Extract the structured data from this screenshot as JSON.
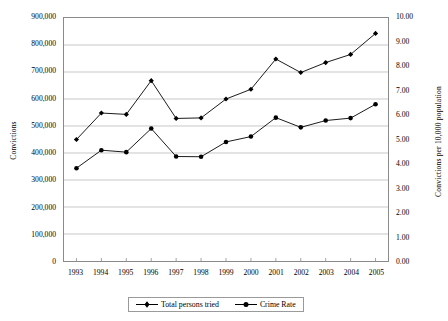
{
  "chart_data": {
    "type": "line",
    "title": "",
    "subtitle": "",
    "xlabel": "",
    "ylabel": "Convictions",
    "y2label": "Convictions per 10,000 population",
    "grid": true,
    "legend_position": "bottom",
    "categories": [
      "1993",
      "1994",
      "1995",
      "1996",
      "1997",
      "1998",
      "1999",
      "2000",
      "2001",
      "2002",
      "2003",
      "2004",
      "2005"
    ],
    "ylim": [
      0,
      900000
    ],
    "yticks": [
      "0",
      "100,000",
      "200,000",
      "300,000",
      "400,000",
      "500,000",
      "600,000",
      "700,000",
      "800,000",
      "900,000"
    ],
    "ytick_values": [
      0,
      100000,
      200000,
      300000,
      400000,
      500000,
      600000,
      700000,
      800000,
      900000
    ],
    "y2lim": [
      0,
      10
    ],
    "y2ticks": [
      "0.00",
      "1.00",
      "2.00",
      "3.00",
      "4.00",
      "5.00",
      "6.00",
      "7.00",
      "8.00",
      "9.00",
      "10.00"
    ],
    "y2tick_values": [
      0,
      1,
      2,
      3,
      4,
      5,
      6,
      7,
      8,
      9,
      10
    ],
    "series": [
      {
        "name": "Total persons tried",
        "axis": "left",
        "color": "#000000",
        "marker": "diamond",
        "values": [
          450000,
          548000,
          543000,
          668000,
          528000,
          530000,
          600000,
          636000,
          748000,
          698000,
          735000,
          765000,
          843000
        ]
      },
      {
        "name": "Crime Rate",
        "axis": "right",
        "color": "#000000",
        "marker": "circle",
        "values": [
          3.82,
          4.56,
          4.48,
          5.45,
          4.3,
          4.29,
          4.9,
          5.12,
          5.9,
          5.5,
          5.78,
          5.88,
          6.45
        ]
      }
    ]
  }
}
